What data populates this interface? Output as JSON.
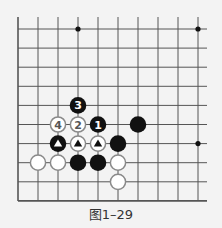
{
  "figure": {
    "caption": "图1–29"
  },
  "board": {
    "columns": 10,
    "rows": 10,
    "origin_x": 18,
    "origin_y": 29,
    "spacing_x": 20,
    "spacing_y": 19.1,
    "open_top": true,
    "open_right": true,
    "line_color": "#555555",
    "star_points": [
      {
        "col": 3,
        "row": 0
      },
      {
        "col": 9,
        "row": 0
      },
      {
        "col": 9,
        "row": 6
      }
    ]
  },
  "stones": [
    {
      "col": 3,
      "row": 4,
      "color": "black",
      "label": "3"
    },
    {
      "col": 2,
      "row": 5,
      "color": "white",
      "label": "4"
    },
    {
      "col": 3,
      "row": 5,
      "color": "white",
      "label": "2"
    },
    {
      "col": 4,
      "row": 5,
      "color": "black",
      "label": "1"
    },
    {
      "col": 6,
      "row": 5,
      "color": "black",
      "label": ""
    },
    {
      "col": 2,
      "row": 6,
      "color": "black",
      "label": "",
      "marker": "triangle"
    },
    {
      "col": 3,
      "row": 6,
      "color": "white",
      "label": "",
      "marker": "triangle"
    },
    {
      "col": 4,
      "row": 6,
      "color": "white",
      "label": "",
      "marker": "triangle"
    },
    {
      "col": 5,
      "row": 6,
      "color": "black",
      "label": ""
    },
    {
      "col": 1,
      "row": 7,
      "color": "white",
      "label": ""
    },
    {
      "col": 2,
      "row": 7,
      "color": "white",
      "label": ""
    },
    {
      "col": 3,
      "row": 7,
      "color": "black",
      "label": ""
    },
    {
      "col": 4,
      "row": 7,
      "color": "black",
      "label": ""
    },
    {
      "col": 5,
      "row": 7,
      "color": "white",
      "label": ""
    },
    {
      "col": 5,
      "row": 8,
      "color": "white",
      "label": ""
    }
  ],
  "colors": {
    "black_stone": "#111111",
    "white_stone_fill": "#ffffff",
    "white_stone_stroke": "#8a8a8a",
    "white_label": "#555555",
    "black_label": "#ffffff"
  }
}
